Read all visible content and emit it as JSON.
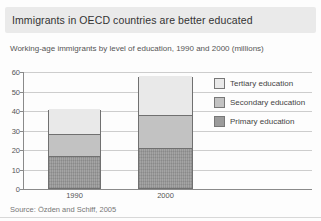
{
  "header": {
    "title": "Immigrants in OECD countries are better educated"
  },
  "subtitle": "Working-age immigrants by level of education, 1990 and 2000 (millions)",
  "source": "Source: Özden and Schiff, 2005",
  "colors": {
    "header_band": "#eaeaea",
    "tertiary": "#e9e9e9",
    "secondary": "#c2c2c2",
    "primary": "#9b9b9b",
    "bar_border": "#707070",
    "gridline": "#cdcdcd",
    "axis": "#8a8a8a"
  },
  "chart_data": {
    "type": "bar",
    "stacked": true,
    "categories": [
      "1990",
      "2000"
    ],
    "series": [
      {
        "name": "Primary education",
        "values": [
          16.5,
          20.5
        ],
        "color": "#9b9b9b"
      },
      {
        "name": "Secondary education",
        "values": [
          11,
          17
        ],
        "color": "#c2c2c2"
      },
      {
        "name": "Tertiary education",
        "values": [
          13,
          20
        ],
        "color": "#e9e9e9"
      }
    ],
    "totals": [
      40.5,
      57.5
    ],
    "title": "Immigrants in OECD countries are better educated",
    "xlabel": "",
    "ylabel": "",
    "ylim": [
      0,
      60
    ],
    "yticks": [
      0,
      10,
      20,
      30,
      40,
      50,
      60
    ],
    "grid": true,
    "legend": {
      "position": "inside-right",
      "entries": [
        "Tertiary education",
        "Secondary education",
        "Primary education"
      ]
    }
  }
}
